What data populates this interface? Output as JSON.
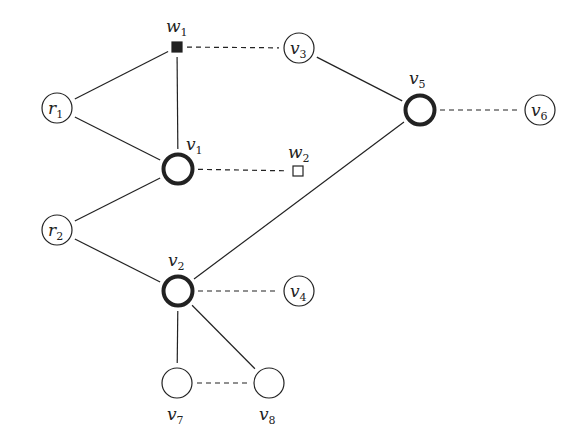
{
  "diagram": {
    "type": "graph",
    "nodes": [
      {
        "id": "w1",
        "label": "w",
        "sub": "1",
        "shape": "square-filled",
        "x": 177,
        "y": 47,
        "label_x": 166,
        "label_y": 32
      },
      {
        "id": "v3",
        "label": "v",
        "sub": "3",
        "shape": "circle",
        "x": 299,
        "y": 48,
        "label_x": 290,
        "label_y": 54
      },
      {
        "id": "r1",
        "label": "r",
        "sub": "1",
        "shape": "circle",
        "x": 57,
        "y": 108,
        "label_x": 48,
        "label_y": 114
      },
      {
        "id": "v5",
        "label": "v",
        "sub": "5",
        "shape": "circle-bold",
        "x": 420,
        "y": 110,
        "label_x": 409,
        "label_y": 84
      },
      {
        "id": "v6",
        "label": "v",
        "sub": "6",
        "shape": "circle",
        "x": 540,
        "y": 110,
        "label_x": 531,
        "label_y": 116
      },
      {
        "id": "v1",
        "label": "v",
        "sub": "1",
        "shape": "circle-bold",
        "x": 178,
        "y": 169,
        "label_x": 186,
        "label_y": 150
      },
      {
        "id": "w2",
        "label": "w",
        "sub": "2",
        "shape": "square-open",
        "x": 298,
        "y": 171,
        "label_x": 288,
        "label_y": 158
      },
      {
        "id": "r2",
        "label": "r",
        "sub": "2",
        "shape": "circle",
        "x": 57,
        "y": 230,
        "label_x": 48,
        "label_y": 236
      },
      {
        "id": "v2",
        "label": "v",
        "sub": "2",
        "shape": "circle-bold",
        "x": 178,
        "y": 291,
        "label_x": 168,
        "label_y": 266
      },
      {
        "id": "v4",
        "label": "v",
        "sub": "4",
        "shape": "circle",
        "x": 299,
        "y": 291,
        "label_x": 290,
        "label_y": 297
      },
      {
        "id": "v7",
        "label": "v",
        "sub": "7",
        "shape": "circle",
        "x": 177,
        "y": 383,
        "label_x": 167,
        "label_y": 420
      },
      {
        "id": "v8",
        "label": "v",
        "sub": "8",
        "shape": "circle",
        "x": 269,
        "y": 383,
        "label_x": 259,
        "label_y": 420
      }
    ],
    "edges": [
      {
        "from": "w1",
        "to": "r1",
        "style": "solid"
      },
      {
        "from": "w1",
        "to": "v1",
        "style": "solid"
      },
      {
        "from": "w1",
        "to": "v3",
        "style": "dashed"
      },
      {
        "from": "r1",
        "to": "v1",
        "style": "solid"
      },
      {
        "from": "v3",
        "to": "v5",
        "style": "solid"
      },
      {
        "from": "v5",
        "to": "v6",
        "style": "dashed"
      },
      {
        "from": "v1",
        "to": "w2",
        "style": "dashed"
      },
      {
        "from": "v1",
        "to": "r2",
        "style": "solid"
      },
      {
        "from": "r2",
        "to": "v2",
        "style": "solid"
      },
      {
        "from": "v2",
        "to": "v5",
        "style": "solid"
      },
      {
        "from": "v2",
        "to": "v4",
        "style": "dashed"
      },
      {
        "from": "v2",
        "to": "v7",
        "style": "solid"
      },
      {
        "from": "v2",
        "to": "v8",
        "style": "solid"
      },
      {
        "from": "v7",
        "to": "v8",
        "style": "dashed"
      }
    ],
    "colors": {
      "stroke": "#222222",
      "background": "#ffffff"
    }
  }
}
